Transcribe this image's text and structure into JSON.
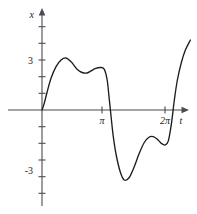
{
  "figure": {
    "title": "",
    "background_color": "#ffffff",
    "curve_color": "#1d1d20",
    "axis_color": "#4a4a52",
    "width": 197,
    "height": 214
  },
  "axes": {
    "x_axis_label": "t",
    "y_axis_label": "x",
    "x_tick_labels": [
      "π",
      "2π"
    ],
    "y_tick_labels": [
      "3",
      "-3"
    ]
  },
  "chart_data": {
    "type": "line",
    "title": "",
    "xlabel": "t",
    "ylabel": "x",
    "grid": false,
    "legend": null,
    "xlim": [
      -0.55,
      7.95
    ],
    "ylim": [
      -5.9,
      5.9
    ],
    "xticks": [
      3.14159,
      6.28319
    ],
    "xticklabels": [
      "π",
      "2π"
    ],
    "yticks": [
      -5,
      -4,
      -3,
      -2,
      -1,
      1,
      2,
      3,
      4,
      5
    ],
    "yticklabels_shown": {
      "3": "3",
      "-3": "-3"
    },
    "series": [
      {
        "name": "x(t)",
        "x": [
          0.0,
          0.1,
          0.25,
          0.45,
          0.7,
          0.95,
          1.2,
          1.45,
          1.55,
          1.75,
          2.0,
          2.25,
          2.45,
          2.65,
          2.9,
          3.1,
          3.25,
          3.35,
          3.45,
          3.55,
          3.7,
          3.9,
          4.1,
          4.35,
          4.6,
          4.85,
          5.1,
          5.35,
          5.55,
          5.75,
          5.95,
          6.15,
          6.3,
          6.45,
          6.6,
          6.75,
          6.95,
          7.15,
          7.4
        ],
        "y": [
          0.0,
          0.35,
          1.05,
          1.9,
          2.6,
          3.0,
          3.12,
          2.9,
          2.75,
          2.45,
          2.25,
          2.22,
          2.35,
          2.48,
          2.55,
          2.45,
          1.8,
          0.7,
          -0.45,
          -1.55,
          -2.7,
          -3.7,
          -4.2,
          -4.05,
          -3.4,
          -2.6,
          -1.95,
          -1.62,
          -1.6,
          -1.75,
          -2.0,
          -2.1,
          -1.85,
          -0.85,
          0.6,
          1.8,
          2.85,
          3.6,
          4.2
        ],
        "features": {
          "start_point": {
            "t": 0,
            "x": 0
          },
          "first_peak": {
            "t": 1.25,
            "x": 3.1
          },
          "local_min_upper": {
            "t": 2.25,
            "x": 2.2
          },
          "second_peak": {
            "t": 2.9,
            "x": 2.55
          },
          "zero_crossing_descending": {
            "t": 3.4,
            "x": 0
          },
          "global_min": {
            "t": 4.1,
            "x": -4.2
          },
          "local_max_lower": {
            "t": 5.5,
            "x": -1.6
          },
          "local_min_lower": {
            "t": 6.15,
            "x": -2.1
          },
          "zero_crossing_ascending": {
            "t": 6.58,
            "x": 0
          },
          "end_point": {
            "t": 7.4,
            "x": 4.2
          }
        }
      }
    ]
  }
}
